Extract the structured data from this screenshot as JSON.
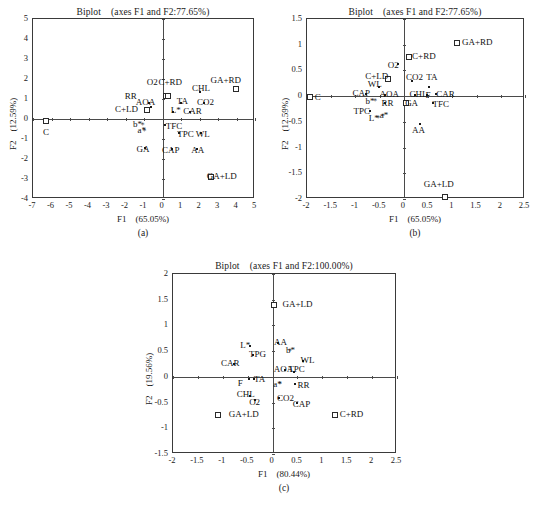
{
  "figure": {
    "panels": [
      {
        "caption": "(a)",
        "title": "Biplot　(axes F1 and F2:77.65%)",
        "xlabel": "F1　(65.05%)",
        "ylabel": "F2　(12.59%)",
        "xlim": [
          -7,
          5
        ],
        "ylim": [
          -4,
          5
        ],
        "xticks": [
          -7,
          -6,
          -5,
          -4,
          -3,
          -2,
          -1,
          0,
          1,
          2,
          3,
          4,
          5
        ],
        "yticks": [
          -4,
          -3,
          -2,
          -1,
          0,
          1,
          2,
          3,
          4,
          5
        ],
        "points": [
          {
            "label": "C",
            "x": -6.3,
            "y": -0.1,
            "marker": "square",
            "lx": -6.3,
            "ly": -0.72,
            "anchor": "center"
          },
          {
            "label": "C+LD",
            "x": -0.85,
            "y": 0.45,
            "marker": "square",
            "lx": -1.95,
            "ly": 0.45,
            "anchor": "center"
          },
          {
            "label": "RR",
            "x": -0.75,
            "y": 0.8,
            "marker": "dot",
            "lx": -1.72,
            "ly": 1.08,
            "anchor": "center"
          },
          {
            "label": "AOA",
            "x": -0.62,
            "y": 0.62,
            "marker": "dot",
            "lx": -0.92,
            "ly": 0.78,
            "anchor": "center"
          },
          {
            "label": "O2",
            "x": 0.18,
            "y": 1.15,
            "marker": "square",
            "lx": -0.55,
            "ly": 1.78,
            "anchor": "center"
          },
          {
            "label": "C+RD",
            "x": 0.3,
            "y": 1.15,
            "marker": "square",
            "lx": 0.42,
            "ly": 1.82,
            "anchor": "center"
          },
          {
            "label": "GA+RD",
            "x": 3.95,
            "y": 1.5,
            "marker": "square",
            "lx": 3.42,
            "ly": 1.9,
            "anchor": "center"
          },
          {
            "label": "CHL",
            "x": 2.0,
            "y": 1.35,
            "marker": "dot",
            "lx": 2.08,
            "ly": 1.52,
            "anchor": "center"
          },
          {
            "label": "TA",
            "x": 1.0,
            "y": 0.82,
            "marker": "dot",
            "lx": 1.08,
            "ly": 0.85,
            "anchor": "center"
          },
          {
            "label": "CO2",
            "x": 2.25,
            "y": 0.8,
            "marker": "dot",
            "lx": 2.32,
            "ly": 0.8,
            "anchor": "center"
          },
          {
            "label": "L*",
            "x": 0.55,
            "y": 0.35,
            "marker": "dot",
            "lx": 0.72,
            "ly": 0.38,
            "anchor": "center"
          },
          {
            "label": "CAR",
            "x": 1.5,
            "y": 0.35,
            "marker": "dot",
            "lx": 1.62,
            "ly": 0.35,
            "anchor": "center"
          },
          {
            "label": "b*",
            "x": -1.15,
            "y": -0.3,
            "marker": "star",
            "lx": -1.35,
            "ly": -0.32,
            "anchor": "center"
          },
          {
            "label": "a*",
            "x": -1.05,
            "y": -0.58,
            "marker": "star",
            "lx": -1.12,
            "ly": -0.62,
            "anchor": "center"
          },
          {
            "label": "TFC",
            "x": 0.15,
            "y": -0.3,
            "marker": "dot",
            "lx": 0.62,
            "ly": -0.38,
            "anchor": "center"
          },
          {
            "label": "TPC",
            "x": 0.9,
            "y": -0.72,
            "marker": "dot",
            "lx": 1.25,
            "ly": -0.82,
            "anchor": "center"
          },
          {
            "label": "WL",
            "x": 2.1,
            "y": -0.72,
            "marker": "dot",
            "lx": 2.18,
            "ly": -0.78,
            "anchor": "center"
          },
          {
            "label": "GA",
            "x": -0.95,
            "y": -1.45,
            "marker": "dot",
            "lx": -1.05,
            "ly": -1.55,
            "anchor": "center"
          },
          {
            "label": "CAP",
            "x": 0.5,
            "y": -1.5,
            "marker": "dot",
            "lx": 0.45,
            "ly": -1.58,
            "anchor": "center"
          },
          {
            "label": "AA",
            "x": 1.85,
            "y": -1.5,
            "marker": "dot",
            "lx": 1.9,
            "ly": -1.6,
            "anchor": "center"
          },
          {
            "label": "GA+LD",
            "x": 2.62,
            "y": -2.88,
            "marker": "square",
            "lx": 3.2,
            "ly": -2.9,
            "anchor": "center"
          }
        ]
      },
      {
        "caption": "(b)",
        "title": "Biplot　(axes F1 and F2:77.65%)",
        "xlabel": "F1　(65.05%)",
        "ylabel": "F2　(12.59%)",
        "xlim": [
          -2,
          2.5
        ],
        "ylim": [
          -2,
          1.5
        ],
        "xticks": [
          -2,
          -1.5,
          -1,
          -0.5,
          0,
          0.5,
          1,
          1.5,
          2,
          2.5
        ],
        "yticks": [
          -2,
          -1.5,
          -1,
          -0.5,
          0,
          0.5,
          1,
          1.5
        ],
        "points": [
          {
            "label": "C",
            "x": -1.94,
            "y": -0.02,
            "marker": "square",
            "lx": -1.84,
            "ly": -0.03,
            "anchor": "left"
          },
          {
            "label": "GA+RD",
            "x": 1.1,
            "y": 1.03,
            "marker": "square",
            "lx": 1.2,
            "ly": 1.03,
            "anchor": "left"
          },
          {
            "label": "C+RD",
            "x": 0.1,
            "y": 0.76,
            "marker": "square",
            "lx": 0.17,
            "ly": 0.76,
            "anchor": "left"
          },
          {
            "label": "O2",
            "x": -0.12,
            "y": 0.62,
            "marker": "dot",
            "lx": -0.22,
            "ly": 0.58,
            "anchor": "center"
          },
          {
            "label": "C+LD",
            "x": -0.33,
            "y": 0.33,
            "marker": "square",
            "lx": -0.56,
            "ly": 0.37,
            "anchor": "center"
          },
          {
            "label": "CO2",
            "x": 0.16,
            "y": 0.3,
            "marker": "dot",
            "lx": 0.22,
            "ly": 0.36,
            "anchor": "center"
          },
          {
            "label": "TA",
            "x": 0.52,
            "y": 0.18,
            "marker": "dot",
            "lx": 0.58,
            "ly": 0.36,
            "anchor": "center"
          },
          {
            "label": "WL",
            "x": -0.52,
            "y": 0.18,
            "marker": "dot",
            "lx": -0.6,
            "ly": 0.22,
            "anchor": "center"
          },
          {
            "label": "CAP",
            "x": -0.78,
            "y": 0.04,
            "marker": "dot",
            "lx": -0.88,
            "ly": 0.04,
            "anchor": "center"
          },
          {
            "label": "AOA",
            "x": -0.38,
            "y": 0.03,
            "marker": "dot",
            "lx": -0.3,
            "ly": 0.03,
            "anchor": "center"
          },
          {
            "label": "CHL",
            "x": 0.22,
            "y": 0.03,
            "marker": "dot",
            "lx": 0.3,
            "ly": 0.03,
            "anchor": "center"
          },
          {
            "label": "F",
            "x": 0.48,
            "y": 0.02,
            "marker": "dot",
            "lx": 0.5,
            "ly": 0.0,
            "anchor": "center"
          },
          {
            "label": "CAR",
            "x": 0.66,
            "y": 0.05,
            "marker": "dot",
            "lx": 0.86,
            "ly": 0.03,
            "anchor": "center"
          },
          {
            "label": "b*",
            "x": -0.62,
            "y": -0.1,
            "marker": "star",
            "lx": -0.7,
            "ly": -0.12,
            "anchor": "center"
          },
          {
            "label": "RR",
            "x": -0.38,
            "y": -0.13,
            "marker": "dot",
            "lx": -0.34,
            "ly": -0.16,
            "anchor": "center"
          },
          {
            "label": "GA",
            "x": 0.04,
            "y": -0.14,
            "marker": "square",
            "lx": 0.16,
            "ly": -0.16,
            "anchor": "center"
          },
          {
            "label": "TFC",
            "x": 0.6,
            "y": -0.13,
            "marker": "dot",
            "lx": 0.76,
            "ly": -0.18,
            "anchor": "center"
          },
          {
            "label": "TPC",
            "x": -0.7,
            "y": -0.28,
            "marker": "dot",
            "lx": -0.87,
            "ly": -0.3,
            "anchor": "center"
          },
          {
            "label": "a*",
            "x": -0.46,
            "y": -0.38,
            "marker": "star",
            "lx": -0.41,
            "ly": -0.39,
            "anchor": "center"
          },
          {
            "label": "L*",
            "x": -0.56,
            "y": -0.42,
            "marker": "star",
            "lx": -0.62,
            "ly": -0.44,
            "anchor": "center"
          },
          {
            "label": "AA",
            "x": 0.33,
            "y": -0.54,
            "marker": "dot",
            "lx": 0.3,
            "ly": -0.68,
            "anchor": "center"
          },
          {
            "label": "GA+LD",
            "x": 0.85,
            "y": -1.97,
            "marker": "square",
            "lx": 0.72,
            "ly": -1.72,
            "anchor": "center"
          }
        ]
      },
      {
        "caption": "(c)",
        "title": "Biplot　(axes F1 and F2:100.00%)",
        "xlabel": "F1　(80.44%)",
        "ylabel": "F2　(19.56%)",
        "xlim": [
          -2,
          2.5
        ],
        "ylim": [
          -1.5,
          2
        ],
        "xticks": [
          -2,
          -1.5,
          -1,
          -0.5,
          0,
          0.5,
          1,
          1.5,
          2,
          2.5
        ],
        "yticks": [
          -1.5,
          -1,
          -0.5,
          0,
          0.5,
          1,
          1.5,
          2
        ],
        "points": [
          {
            "label": "GA+LD",
            "x": 0.03,
            "y": 1.4,
            "marker": "square",
            "lx": 0.2,
            "ly": 1.4,
            "anchor": "left"
          },
          {
            "label": "AA",
            "x": 0.1,
            "y": 0.66,
            "marker": "dot",
            "lx": 0.16,
            "ly": 0.66,
            "anchor": "center"
          },
          {
            "label": "L*",
            "x": -0.45,
            "y": 0.6,
            "marker": "dot",
            "lx": -0.55,
            "ly": 0.6,
            "anchor": "center"
          },
          {
            "label": "b*",
            "x": 0.32,
            "y": 0.5,
            "marker": "star",
            "lx": 0.36,
            "ly": 0.5,
            "anchor": "center"
          },
          {
            "label": "TPG",
            "x": -0.4,
            "y": 0.42,
            "marker": "dot",
            "lx": -0.3,
            "ly": 0.42,
            "anchor": "center"
          },
          {
            "label": "WL",
            "x": 0.62,
            "y": 0.3,
            "marker": "dot",
            "lx": 0.7,
            "ly": 0.3,
            "anchor": "center"
          },
          {
            "label": "CAR",
            "x": -0.78,
            "y": 0.25,
            "marker": "dot",
            "lx": -0.85,
            "ly": 0.25,
            "anchor": "center"
          },
          {
            "label": "AOA",
            "x": 0.25,
            "y": 0.13,
            "marker": "dot",
            "lx": 0.22,
            "ly": 0.13,
            "anchor": "center"
          },
          {
            "label": "TPC",
            "x": 0.43,
            "y": 0.1,
            "marker": "dot",
            "lx": 0.48,
            "ly": 0.13,
            "anchor": "center"
          },
          {
            "label": "TA",
            "x": -0.38,
            "y": -0.05,
            "marker": "dot",
            "lx": -0.26,
            "ly": -0.06,
            "anchor": "center"
          },
          {
            "label": "F",
            "x": -0.48,
            "y": -0.04,
            "marker": "dot",
            "lx": -0.65,
            "ly": -0.14,
            "anchor": "center"
          },
          {
            "label": "a*",
            "x": 0.12,
            "y": -0.14,
            "marker": "star",
            "lx": 0.1,
            "ly": -0.16,
            "anchor": "center"
          },
          {
            "label": "RR",
            "x": 0.45,
            "y": -0.14,
            "marker": "dot",
            "lx": 0.62,
            "ly": -0.18,
            "anchor": "center"
          },
          {
            "label": "CHL",
            "x": -0.45,
            "y": -0.38,
            "marker": "dot",
            "lx": -0.54,
            "ly": -0.36,
            "anchor": "center"
          },
          {
            "label": "CO2",
            "x": 0.12,
            "y": -0.42,
            "marker": "dot",
            "lx": 0.26,
            "ly": -0.44,
            "anchor": "center"
          },
          {
            "label": "O2",
            "x": -0.36,
            "y": -0.45,
            "marker": "dot",
            "lx": -0.36,
            "ly": -0.5,
            "anchor": "center"
          },
          {
            "label": "CAP",
            "x": 0.5,
            "y": -0.5,
            "marker": "dot",
            "lx": 0.58,
            "ly": -0.54,
            "anchor": "center"
          },
          {
            "label": "GA+LD",
            "x": -1.1,
            "y": -0.74,
            "marker": "square",
            "lx": -0.88,
            "ly": -0.74,
            "anchor": "left"
          },
          {
            "label": "C+RD",
            "x": 1.25,
            "y": -0.74,
            "marker": "square",
            "lx": 1.35,
            "ly": -0.74,
            "anchor": "left"
          }
        ]
      }
    ]
  }
}
